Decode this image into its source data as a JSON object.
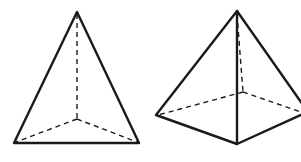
{
  "figures": [
    {
      "name": "triangular-pyramid",
      "description": "Tetrahedron with hidden edges shown dashed",
      "visible_edges": [
        [
          [
            77,
            12
          ],
          [
            14,
            143
          ]
        ],
        [
          [
            77,
            12
          ],
          [
            139,
            143
          ]
        ],
        [
          [
            14,
            143
          ],
          [
            139,
            143
          ]
        ]
      ],
      "hidden_edges": [
        [
          [
            77,
            12
          ],
          [
            77,
            119
          ]
        ],
        [
          [
            77,
            119
          ],
          [
            14,
            143
          ]
        ],
        [
          [
            77,
            119
          ],
          [
            139,
            143
          ]
        ]
      ]
    },
    {
      "name": "square-pyramid",
      "description": "Quadrilateral pyramid with hidden edges shown dashed",
      "visible_edges": [
        [
          [
            237,
            11
          ],
          [
            156,
            115
          ]
        ],
        [
          [
            237,
            11
          ],
          [
            237,
            144
          ]
        ],
        [
          [
            237,
            11
          ],
          [
            301,
            108
          ]
        ],
        [
          [
            156,
            115
          ],
          [
            237,
            144
          ]
        ],
        [
          [
            237,
            144
          ],
          [
            301,
            112
          ]
        ]
      ],
      "hidden_edges": [
        [
          [
            237,
            11
          ],
          [
            243,
            92
          ]
        ],
        [
          [
            243,
            92
          ],
          [
            156,
            115
          ]
        ],
        [
          [
            243,
            92
          ],
          [
            301,
            112
          ]
        ]
      ]
    }
  ],
  "colors": {
    "stroke": "#1a1a1a",
    "background": "#ffffff"
  }
}
